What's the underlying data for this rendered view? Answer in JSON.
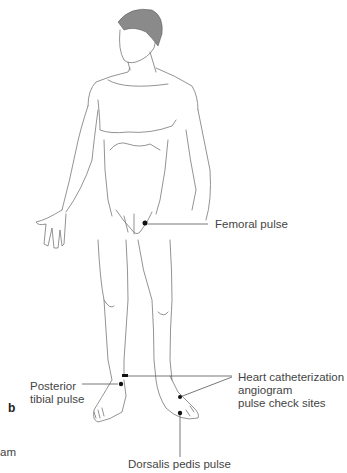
{
  "diagram": {
    "panel_letter": "b",
    "cropped_text": "am",
    "labels": {
      "femoral": "Femoral pulse",
      "posterior_tibial": [
        "Posterior",
        "tibial pulse"
      ],
      "heart_cath": [
        "Heart catheterization",
        "angiogram",
        "pulse check sites"
      ],
      "dorsalis_pedis": "Dorsalis pedis pulse"
    },
    "colors": {
      "line": "#555555",
      "dot": "#111111",
      "hair": "#8a8a8a"
    }
  }
}
